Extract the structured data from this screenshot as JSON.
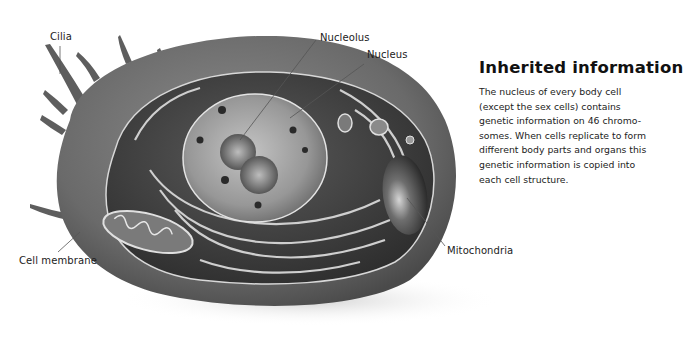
{
  "diagram": {
    "labels": [
      {
        "id": "cilia",
        "text": "Cilia"
      },
      {
        "id": "nucleolus",
        "text": "Nucleolus"
      },
      {
        "id": "nucleus",
        "text": "Nucleus"
      },
      {
        "id": "cell_membrane",
        "text": "Cell membrane"
      },
      {
        "id": "mitochondria",
        "text": "Mitochondria"
      }
    ]
  },
  "info": {
    "title": "Inherited information",
    "body": "The nucleus of every body cell (except the sex cells) contains genetic information on 46 chromo-somes. When cells replicate to form different body parts and organs this genetic information is copied into each cell structure."
  },
  "colors": {
    "background": "#ffffff",
    "cell_outer": "#6e6e6e",
    "cell_inner": "#3e3e3e",
    "nucleus": "#9a9a9a",
    "leader_line": "#555555",
    "text": "#1a1a1a"
  }
}
